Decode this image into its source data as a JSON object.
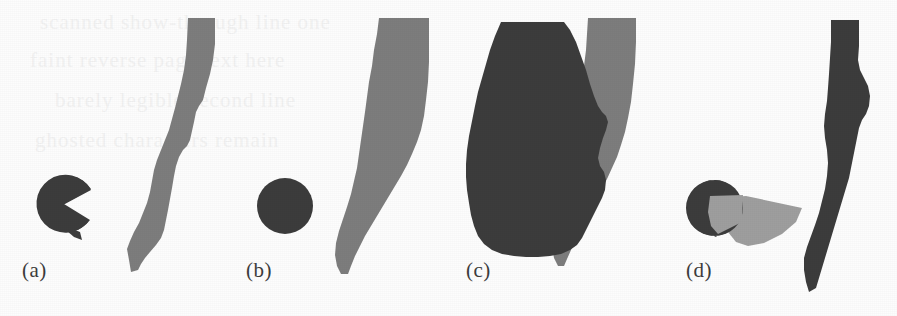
{
  "figure": {
    "width": 897,
    "height": 316,
    "background_color": "#fdfdfd",
    "caption_style": "lowercase letter in parentheses, below each panel",
    "colors": {
      "dark_gray": "#3c3c3c",
      "mid_gray": "#7d7d7d",
      "light_gray": "#9e9e9e",
      "paper_white": "#fdfdfd",
      "bleed_through": "#f2f2f2"
    }
  },
  "bleed_text": [
    {
      "text": "scanned show-through line one",
      "x": 40,
      "y": 18
    },
    {
      "text": "faint reverse page text here",
      "x": 30,
      "y": 56
    },
    {
      "text": "barely legible second line",
      "x": 55,
      "y": 96
    },
    {
      "text": "ghosted characters remain",
      "x": 35,
      "y": 136
    }
  ],
  "panels": [
    {
      "id": "a",
      "label": "(a)",
      "label_x": 22,
      "label_y": 262,
      "shapes": [
        {
          "name": "dark-disk-with-wedge-notch",
          "kind": "pac-man-disk",
          "fill": "#3c3c3c",
          "center": [
            64,
            204
          ],
          "radius": 28,
          "notch_start_deg": -28,
          "notch_end_deg": 30
        },
        {
          "name": "mid-gray-curved-band",
          "kind": "curved-vertical-band",
          "fill": "#7d7d7d",
          "top": 18,
          "bottom": 272
        }
      ]
    },
    {
      "id": "b",
      "label": "(b)",
      "label_x": 246,
      "label_y": 262,
      "shapes": [
        {
          "name": "dark-disk-solid",
          "kind": "disk",
          "fill": "#3c3c3c",
          "center": [
            285,
            206
          ],
          "radius": 27
        },
        {
          "name": "mid-gray-curved-band",
          "kind": "curved-vertical-band",
          "fill": "#7d7d7d",
          "top": 18,
          "bottom": 272
        }
      ]
    },
    {
      "id": "c",
      "label": "(c)",
      "label_x": 466,
      "label_y": 262,
      "shapes": [
        {
          "name": "mid-gray-band-behind",
          "kind": "curved-vertical-band",
          "fill": "#7d7d7d"
        },
        {
          "name": "large-dark-occluder-polygon",
          "kind": "polygon",
          "fill": "#3c3c3c"
        }
      ]
    },
    {
      "id": "d",
      "label": "(d)",
      "label_x": 686,
      "label_y": 262,
      "shapes": [
        {
          "name": "dark-disk-solid",
          "kind": "disk",
          "fill": "#3c3c3c",
          "center": [
            714,
            208
          ],
          "radius": 28
        },
        {
          "name": "light-gray-cone",
          "kind": "cone",
          "fill": "#9e9e9e",
          "apex": [
            800,
            212
          ]
        },
        {
          "name": "dark-curved-band",
          "kind": "curved-vertical-band",
          "fill": "#3c3c3c",
          "top": 20,
          "bottom": 292
        }
      ]
    }
  ]
}
